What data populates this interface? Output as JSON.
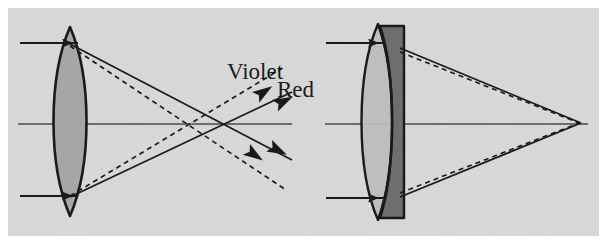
{
  "figure": {
    "width": 607,
    "height": 244,
    "outer_background_color": "#ffffff",
    "plate_background_color": "#d9d9d9",
    "plate_border_color": "#ffffff",
    "ink_color": "#1a1a1a"
  },
  "labels": {
    "violet": "Violet",
    "red": "Red"
  },
  "colors": {
    "crown_glass_fill": "#a6a6a6",
    "flint_glass_fill": "#6e6e6e",
    "doublet_front_fill": "#bdbdbd",
    "ray_solid": "#1a1a1a",
    "ray_dashed": "#1a1a1a",
    "axis": "#4a4a4a"
  },
  "panels": [
    {
      "id": "singlet-panel",
      "name": "simple-lens-panel",
      "caption_text": "",
      "optical_axis": {
        "x1": 18,
        "y1": 124,
        "x2": 292,
        "y2": 124
      },
      "lens": {
        "type": "biconvex-singlet",
        "center_x": 70,
        "top_y": 27,
        "bottom_y": 216,
        "half_thickness": 17,
        "fill": "#a6a6a6"
      },
      "incoming_rays": [
        {
          "name": "upper-incoming-ray",
          "x1": 20,
          "y1": 43,
          "x2": 76,
          "y2": 43,
          "arrow_at": 46
        },
        {
          "name": "lower-incoming-ray",
          "x1": 20,
          "y1": 196,
          "x2": 76,
          "y2": 196,
          "arrow_at": 46
        }
      ],
      "refracted_rays": [
        {
          "name": "violet-upper-ray",
          "style": "dashed",
          "color_label": "Violet",
          "x1": 69,
          "y1": 45,
          "x2": 290,
          "y2": 184
        },
        {
          "name": "violet-lower-ray",
          "style": "dashed",
          "color_label": "Violet",
          "x1": 69,
          "y1": 196,
          "x2": 290,
          "y2": 72
        },
        {
          "name": "red-upper-ray",
          "style": "solid",
          "color_label": "Red",
          "x1": 70,
          "y1": 45,
          "x2": 292,
          "y2": 160
        },
        {
          "name": "red-lower-ray",
          "style": "solid",
          "color_label": "Red",
          "x1": 70,
          "y1": 196,
          "x2": 292,
          "y2": 92
        }
      ],
      "focus_points": [
        {
          "name": "violet-focus",
          "x": 200,
          "y": 124,
          "label": "Violet"
        },
        {
          "name": "red-focus",
          "x": 244,
          "y": 124,
          "label": "Red"
        }
      ],
      "label_positions": {
        "violet": {
          "x": 228,
          "y": 78
        },
        "red": {
          "x": 278,
          "y": 96
        }
      }
    },
    {
      "id": "doublet-panel",
      "name": "achromatic-doublet-panel",
      "caption_text": "",
      "optical_axis": {
        "x1": 325,
        "y1": 124,
        "x2": 588,
        "y2": 124
      },
      "lens": {
        "type": "achromatic-doublet",
        "front_element_fill": "#bdbdbd",
        "rear_element_fill": "#6e6e6e",
        "center_x": 382,
        "top_y": 26,
        "bottom_y": 218
      },
      "incoming_rays": [
        {
          "name": "upper-incoming-ray",
          "x1": 326,
          "y1": 43,
          "x2": 384,
          "y2": 43,
          "arrow_at": 352
        },
        {
          "name": "lower-incoming-ray",
          "x1": 326,
          "y1": 198,
          "x2": 384,
          "y2": 198,
          "arrow_at": 352
        }
      ],
      "refracted_rays": [
        {
          "name": "violet-upper-ray",
          "style": "dashed",
          "color_label": "Violet",
          "x1": 400,
          "y1": 50,
          "x2": 580,
          "y2": 123
        },
        {
          "name": "violet-lower-ray",
          "style": "dashed",
          "color_label": "Violet",
          "x1": 400,
          "y1": 193,
          "x2": 580,
          "y2": 123
        },
        {
          "name": "red-upper-ray",
          "style": "solid",
          "color_label": "Red",
          "x1": 400,
          "y1": 48,
          "x2": 580,
          "y2": 123
        },
        {
          "name": "red-lower-ray",
          "style": "solid",
          "color_label": "Red",
          "x1": 400,
          "y1": 196,
          "x2": 580,
          "y2": 123
        }
      ],
      "focus_points": [
        {
          "name": "common-focus",
          "x": 580,
          "y": 123,
          "label": "Red and Violet"
        }
      ],
      "label_positions": {}
    }
  ],
  "diverging_arrowheads": [
    {
      "name": "violet-up-arrowhead",
      "x": 262,
      "y": 85,
      "angle_deg": -32
    },
    {
      "name": "red-up-arrowhead",
      "x": 285,
      "y": 93,
      "angle_deg": -26
    },
    {
      "name": "red-down-arrowhead",
      "x": 284,
      "y": 150,
      "angle_deg": 26
    },
    {
      "name": "violet-down-arrowhead",
      "x": 258,
      "y": 160,
      "angle_deg": 32
    }
  ]
}
